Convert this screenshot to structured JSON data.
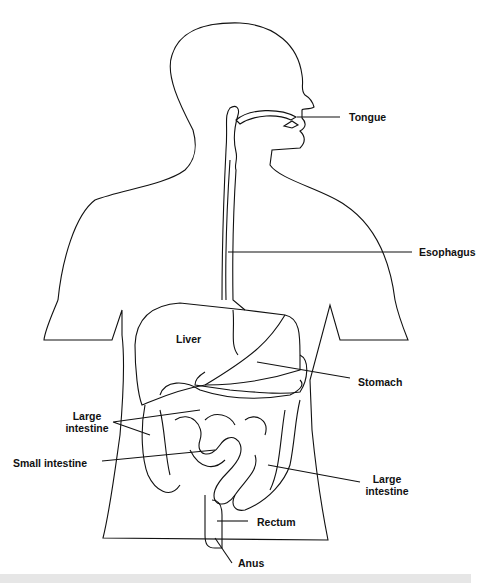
{
  "diagram": {
    "labels": {
      "tongue": "Tongue",
      "esophagus": "Esophagus",
      "liver": "Liver",
      "stomach": "Stomach",
      "large_intestine_left_1": "Large",
      "large_intestine_left_2": "intestine",
      "small_intestine": "Small intestine",
      "large_intestine_right_1": "Large",
      "large_intestine_right_2": "intestine",
      "rectum": "Rectum",
      "anus": "Anus"
    },
    "colors": {
      "line": "#111111",
      "background": "#ffffff",
      "strip": "#e6e6e6"
    }
  }
}
